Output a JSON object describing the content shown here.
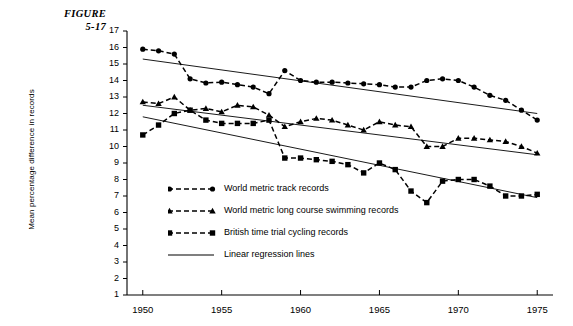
{
  "figure": {
    "label": "FIGURE",
    "number": "5-17"
  },
  "chart_data": {
    "type": "line",
    "title": "",
    "xlabel": "",
    "ylabel": "Mean percentage difference in records",
    "xlim": [
      1949,
      1976
    ],
    "ylim": [
      0,
      17
    ],
    "xticks": [
      1950,
      1955,
      1960,
      1965,
      1970,
      1975
    ],
    "yticks": [
      1,
      2,
      3,
      4,
      5,
      6,
      7,
      8,
      9,
      10,
      11,
      12,
      13,
      14,
      15,
      16,
      17
    ],
    "grid": false,
    "legend_position": "center-left",
    "x": [
      1950,
      1951,
      1952,
      1953,
      1954,
      1955,
      1956,
      1957,
      1958,
      1959,
      1960,
      1961,
      1962,
      1963,
      1964,
      1965,
      1966,
      1967,
      1968,
      1969,
      1970,
      1971,
      1972,
      1973,
      1974,
      1975
    ],
    "series": [
      {
        "name": "World metric track records",
        "marker": "circle",
        "linestyle": "dashed",
        "values": [
          15.9,
          15.8,
          15.6,
          14.1,
          13.85,
          13.9,
          13.75,
          13.6,
          13.2,
          14.6,
          14.0,
          13.9,
          13.9,
          13.85,
          13.8,
          13.75,
          13.6,
          13.6,
          14.0,
          14.1,
          14.0,
          13.6,
          13.1,
          12.8,
          12.2,
          11.6
        ]
      },
      {
        "name": "World metric long course swimming records",
        "marker": "triangle",
        "linestyle": "dashed",
        "values": [
          12.7,
          12.6,
          13.0,
          12.2,
          12.3,
          12.1,
          12.5,
          12.4,
          11.9,
          11.2,
          11.5,
          11.7,
          11.6,
          11.3,
          11.0,
          11.5,
          11.3,
          11.2,
          10.0,
          10.0,
          10.5,
          10.5,
          10.4,
          10.3,
          10.0,
          9.6
        ]
      },
      {
        "name": "British time trial cycling records",
        "marker": "square",
        "linestyle": "dashed",
        "values": [
          10.7,
          11.3,
          12.0,
          12.2,
          11.6,
          11.4,
          11.4,
          11.4,
          11.6,
          9.3,
          9.3,
          9.2,
          9.1,
          8.9,
          8.4,
          9.0,
          8.6,
          7.3,
          6.6,
          7.9,
          8.0,
          8.0,
          7.6,
          7.0,
          7.0,
          7.1
        ]
      }
    ],
    "regression_lines": [
      {
        "name": "Linear regression line (track)",
        "x": [
          1950,
          1975
        ],
        "y": [
          15.3,
          12.0
        ]
      },
      {
        "name": "Linear regression line (swimming)",
        "x": [
          1950,
          1975
        ],
        "y": [
          12.5,
          9.5
        ]
      },
      {
        "name": "Linear regression line (cycling)",
        "x": [
          1950,
          1975
        ],
        "y": [
          11.8,
          6.9
        ]
      }
    ],
    "legend": [
      {
        "label": "World metric track records",
        "marker": "circle",
        "linestyle": "dashed"
      },
      {
        "label": "World metric long course swimming records",
        "marker": "triangle",
        "linestyle": "dashed"
      },
      {
        "label": "British time trial cycling records",
        "marker": "square",
        "linestyle": "dashed"
      },
      {
        "label": "Linear regression lines",
        "marker": "none",
        "linestyle": "solid"
      }
    ],
    "colors": {
      "ink": "#000000",
      "background": "#ffffff"
    }
  }
}
